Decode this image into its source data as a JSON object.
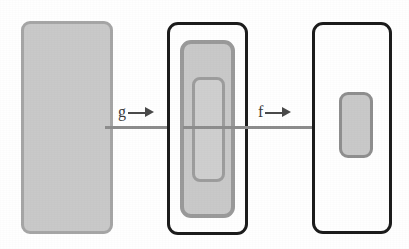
{
  "figure": {
    "background_color": "#ffffff",
    "width": 409,
    "height": 249
  },
  "palette": {
    "fill_gray": "#c9c9c9",
    "fill_gray_light": "#cfcfcf",
    "border_gray": "#9a9a9a",
    "border_dark": "#1c1c1c",
    "line_gray": "#8d8d8d",
    "text_gray": "#3b3b3b"
  },
  "sets": [
    {
      "id": "set-a",
      "name": "left-filled-set",
      "label": "",
      "style": "filled",
      "x": 21,
      "y": 21,
      "w": 92,
      "h": 213
    },
    {
      "id": "set-b",
      "name": "middle-universe",
      "label": "",
      "style": "outline",
      "x": 167,
      "y": 22,
      "w": 81,
      "h": 213
    },
    {
      "id": "set-b-sub1",
      "name": "middle-subset-outer",
      "label": "",
      "style": "subset-mid",
      "x": 180,
      "y": 40,
      "w": 55,
      "h": 178
    },
    {
      "id": "set-b-sub2",
      "name": "middle-subset-inner",
      "label": "",
      "style": "subset-light",
      "x": 192,
      "y": 77,
      "w": 33,
      "h": 105
    },
    {
      "id": "set-c",
      "name": "right-universe",
      "label": "",
      "style": "outline",
      "x": 312,
      "y": 22,
      "w": 80,
      "h": 212
    },
    {
      "id": "set-c-sub",
      "name": "right-subset",
      "label": "",
      "style": "subset-small",
      "x": 339,
      "y": 92,
      "w": 34,
      "h": 66
    }
  ],
  "connectors": [
    {
      "id": "conn-a-b",
      "name": "connector-a-to-b",
      "x": 105,
      "y": 126,
      "w": 80
    },
    {
      "id": "conn-b-c",
      "name": "connector-b-to-c",
      "x": 235,
      "y": 126,
      "w": 110
    }
  ],
  "maps": [
    {
      "id": "map-g",
      "name": "map-label-g",
      "symbol": "g",
      "arrow": "right-arrow-icon",
      "x": 118,
      "y": 104
    },
    {
      "id": "map-f",
      "name": "map-label-f",
      "symbol": "f",
      "arrow": "right-arrow-icon",
      "x": 258,
      "y": 104
    }
  ]
}
